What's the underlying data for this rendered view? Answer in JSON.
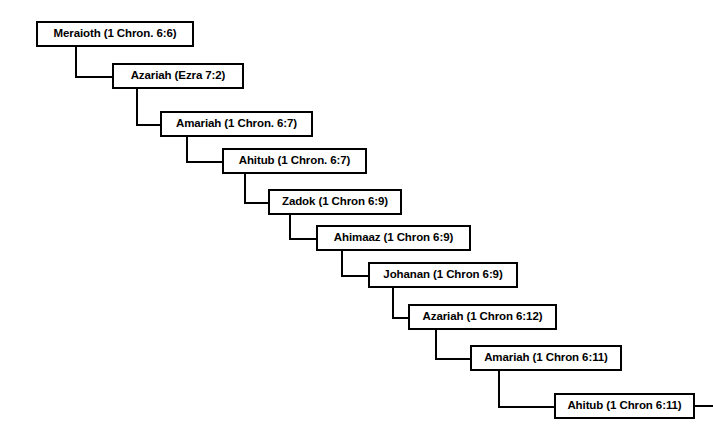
{
  "diagram": {
    "type": "cascading-genealogy-tree",
    "background_color": "#ffffff",
    "line_color": "#000000",
    "text_color": "#000000",
    "nodes": [
      {
        "id": "meraioth",
        "label": "Meraioth (1 Chron. 6:6)",
        "name": "Meraioth",
        "reference": "1 Chron. 6:6",
        "x": 36,
        "y": 21,
        "w": 158,
        "h": 26,
        "generation": 1
      },
      {
        "id": "azariah-ezra",
        "label": "Azariah (Ezra 7:2)",
        "name": "Azariah",
        "reference": "Ezra 7:2",
        "x": 112,
        "y": 63,
        "w": 132,
        "h": 26,
        "generation": 2
      },
      {
        "id": "amariah-67",
        "label": "Amariah (1 Chron. 6:7)",
        "name": "Amariah",
        "reference": "1 Chron. 6:7",
        "x": 160,
        "y": 111,
        "w": 153,
        "h": 26,
        "generation": 3
      },
      {
        "id": "ahitub-67",
        "label": "Ahitub (1 Chron. 6:7)",
        "name": "Ahitub",
        "reference": "1 Chron. 6:7",
        "x": 222,
        "y": 148,
        "w": 145,
        "h": 26,
        "generation": 4
      },
      {
        "id": "zadok-69",
        "label": "Zadok (1 Chron 6:9)",
        "name": "Zadok",
        "reference": "1 Chron 6:9",
        "x": 268,
        "y": 189,
        "w": 134,
        "h": 26,
        "generation": 5
      },
      {
        "id": "ahimaaz-69",
        "label": "Ahimaaz (1 Chron 6:9)",
        "name": "Ahimaaz",
        "reference": "1 Chron 6:9",
        "x": 316,
        "y": 225,
        "w": 155,
        "h": 26,
        "generation": 6
      },
      {
        "id": "johanan-69",
        "label": "Johanan (1 Chron 6:9)",
        "name": "Johanan",
        "reference": "1 Chron 6:9",
        "x": 368,
        "y": 262,
        "w": 150,
        "h": 26,
        "generation": 7
      },
      {
        "id": "azariah-612",
        "label": "Azariah (1 Chron 6:12)",
        "name": "Azariah",
        "reference": "1 Chron 6:12",
        "x": 408,
        "y": 304,
        "w": 149,
        "h": 26,
        "generation": 8
      },
      {
        "id": "amariah-611",
        "label": "Amariah (1 Chron 6:11)",
        "name": "Amariah",
        "reference": "1 Chron 6:11",
        "x": 470,
        "y": 345,
        "w": 152,
        "h": 26,
        "generation": 9
      },
      {
        "id": "ahitub-611",
        "label": "Ahitub (1 Chron 6:11)",
        "name": "Ahitub",
        "reference": "1 Chron 6:11",
        "x": 554,
        "y": 393,
        "w": 141,
        "h": 26,
        "generation": 10
      }
    ],
    "connectors": [
      {
        "id": "c1",
        "from": "meraioth",
        "to": "azariah-ezra",
        "drop_x": 75,
        "from_y": 47,
        "to_y": 76,
        "to_x": 112
      },
      {
        "id": "c2",
        "from": "azariah-ezra",
        "to": "amariah-67",
        "drop_x": 136,
        "from_y": 89,
        "to_y": 124,
        "to_x": 160
      },
      {
        "id": "c3",
        "from": "amariah-67",
        "to": "ahitub-67",
        "drop_x": 186,
        "from_y": 137,
        "to_y": 161,
        "to_x": 222
      },
      {
        "id": "c4",
        "from": "ahitub-67",
        "to": "zadok-69",
        "drop_x": 244,
        "from_y": 174,
        "to_y": 202,
        "to_x": 268
      },
      {
        "id": "c5",
        "from": "zadok-69",
        "to": "ahimaaz-69",
        "drop_x": 289,
        "from_y": 215,
        "to_y": 238,
        "to_x": 316
      },
      {
        "id": "c6",
        "from": "ahimaaz-69",
        "to": "johanan-69",
        "drop_x": 341,
        "from_y": 251,
        "to_y": 275,
        "to_x": 368
      },
      {
        "id": "c7",
        "from": "johanan-69",
        "to": "azariah-612",
        "drop_x": 392,
        "from_y": 288,
        "to_y": 317,
        "to_x": 408
      },
      {
        "id": "c8",
        "from": "azariah-612",
        "to": "amariah-611",
        "drop_x": 435,
        "from_y": 330,
        "to_y": 358,
        "to_x": 470
      },
      {
        "id": "c9",
        "from": "amariah-611",
        "to": "ahitub-611",
        "drop_x": 498,
        "from_y": 371,
        "to_y": 406,
        "to_x": 554
      }
    ],
    "tail": {
      "id": "tail-line",
      "x": 695,
      "y": 405,
      "w": 18,
      "h": 2
    }
  }
}
